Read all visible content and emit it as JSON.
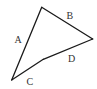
{
  "diagram": {
    "type": "quadrilateral",
    "stroke_color": "#1a1a1a",
    "label_color": "#333333",
    "vertices": {
      "top": [
        41.7,
        7.3
      ],
      "right": [
        92.7,
        39
      ],
      "bend": [
        43.3,
        59.3
      ],
      "bottom_left": [
        11.7,
        80
      ]
    },
    "edges": [
      {
        "id": "A",
        "label": "A",
        "from": "bottom_left",
        "to": "top",
        "label_pos": [
          17.5,
          42
        ]
      },
      {
        "id": "B",
        "label": "B",
        "from": "top",
        "to": "right",
        "label_pos": [
          70,
          18
        ]
      },
      {
        "id": "D",
        "label": "D",
        "from": "right",
        "to": "bend",
        "label_pos": [
          72,
          62
        ]
      },
      {
        "id": "C",
        "label": "C",
        "from": "bend",
        "to": "bottom_left",
        "label_pos": [
          30,
          84
        ]
      }
    ]
  }
}
